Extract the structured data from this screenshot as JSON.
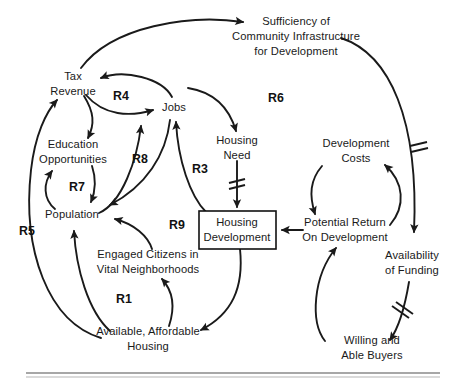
{
  "figure": {
    "type": "causal-loop-diagram",
    "background_color": "#ffffff",
    "ink_color": "#1a1a1a",
    "width": 463,
    "height": 386
  },
  "nodes": [
    {
      "id": "tax_revenue",
      "lines": [
        "Tax",
        "Revenue"
      ],
      "x": 73,
      "y": 84,
      "boxed": false
    },
    {
      "id": "sufficiency",
      "lines": [
        "Sufficiency of",
        "Community Infrastructure",
        "for Development"
      ],
      "x": 296,
      "y": 36,
      "boxed": false
    },
    {
      "id": "jobs",
      "lines": [
        "Jobs"
      ],
      "x": 174,
      "y": 108,
      "boxed": false
    },
    {
      "id": "education",
      "lines": [
        "Education",
        "Opportunities"
      ],
      "x": 73,
      "y": 152,
      "boxed": false
    },
    {
      "id": "housing_need",
      "lines": [
        "Housing",
        "Need"
      ],
      "x": 237,
      "y": 148,
      "boxed": false
    },
    {
      "id": "development_costs",
      "lines": [
        "Development",
        "Costs"
      ],
      "x": 356,
      "y": 151,
      "boxed": false
    },
    {
      "id": "population",
      "lines": [
        "Population"
      ],
      "x": 72,
      "y": 215,
      "boxed": false
    },
    {
      "id": "housing_development",
      "lines": [
        "Housing",
        "Development"
      ],
      "x": 237,
      "y": 230,
      "boxed": true
    },
    {
      "id": "potential_return",
      "lines": [
        "Potential Return",
        "On Development"
      ],
      "x": 345,
      "y": 230,
      "boxed": false
    },
    {
      "id": "availability",
      "lines": [
        "Availability",
        "of Funding"
      ],
      "x": 412,
      "y": 263,
      "boxed": false
    },
    {
      "id": "engaged_citizens",
      "lines": [
        "Engaged Citizens in",
        "Vital Neighborhoods"
      ],
      "x": 148,
      "y": 262,
      "boxed": false
    },
    {
      "id": "affordable_housing",
      "lines": [
        "Available, Affordable",
        "Housing"
      ],
      "x": 148,
      "y": 339,
      "boxed": false
    },
    {
      "id": "willing_buyers",
      "lines": [
        "Willing and",
        "Able Buyers"
      ],
      "x": 372,
      "y": 348,
      "boxed": false
    }
  ],
  "loop_labels": [
    {
      "id": "R4",
      "text": "R4",
      "x": 121,
      "y": 97
    },
    {
      "id": "R6",
      "text": "R6",
      "x": 276,
      "y": 99
    },
    {
      "id": "R8",
      "text": "R8",
      "x": 140,
      "y": 160
    },
    {
      "id": "R3",
      "text": "R3",
      "x": 200,
      "y": 170
    },
    {
      "id": "R7",
      "text": "R7",
      "x": 77,
      "y": 188
    },
    {
      "id": "R5",
      "text": "R5",
      "x": 27,
      "y": 232
    },
    {
      "id": "R9",
      "text": "R9",
      "x": 177,
      "y": 226
    },
    {
      "id": "R1",
      "text": "R1",
      "x": 124,
      "y": 300
    }
  ],
  "links": [
    {
      "id": "tax-to-sufficiency",
      "from": "tax_revenue",
      "to": "sufficiency",
      "delay": false
    },
    {
      "id": "jobs-to-tax",
      "from": "jobs",
      "to": "tax_revenue",
      "delay": false
    },
    {
      "id": "tax-to-jobs",
      "from": "tax_revenue",
      "to": "jobs",
      "delay": false
    },
    {
      "id": "tax-to-education",
      "from": "tax_revenue",
      "to": "education",
      "delay": false
    },
    {
      "id": "education-to-population",
      "from": "education",
      "to": "population",
      "delay": false
    },
    {
      "id": "population-to-education",
      "from": "population",
      "to": "education",
      "delay": false
    },
    {
      "id": "population-to-jobs",
      "from": "population",
      "to": "jobs",
      "delay": false
    },
    {
      "id": "jobs-to-population",
      "from": "jobs",
      "to": "population",
      "delay": false
    },
    {
      "id": "sufficiency-to-housing-need",
      "from": "sufficiency",
      "to": "housing_need",
      "delay": false
    },
    {
      "id": "housing-need-to-development",
      "from": "housing_need",
      "to": "housing_development",
      "delay": true
    },
    {
      "id": "development-to-jobs",
      "from": "housing_development",
      "to": "jobs",
      "delay": false
    },
    {
      "id": "development-to-affordable",
      "from": "housing_development",
      "to": "affordable_housing",
      "delay": false
    },
    {
      "id": "affordable-to-engaged",
      "from": "affordable_housing",
      "to": "engaged_citizens",
      "delay": false
    },
    {
      "id": "engaged-to-population",
      "from": "engaged_citizens",
      "to": "population",
      "delay": false
    },
    {
      "id": "affordable-to-population",
      "from": "affordable_housing",
      "to": "population",
      "delay": false
    },
    {
      "id": "affordable-to-tax",
      "from": "affordable_housing",
      "to": "tax_revenue",
      "delay": false
    },
    {
      "id": "sufficiency-to-availability",
      "from": "sufficiency",
      "to": "availability",
      "delay": true
    },
    {
      "id": "availability-to-willing",
      "from": "availability",
      "to": "willing_buyers",
      "delay": true
    },
    {
      "id": "willing-to-potential",
      "from": "willing_buyers",
      "to": "potential_return",
      "delay": false
    },
    {
      "id": "potential-to-development-costs",
      "from": "potential_return",
      "to": "development_costs",
      "delay": false
    },
    {
      "id": "costs-to-potential",
      "from": "development_costs",
      "to": "potential_return",
      "delay": false
    },
    {
      "id": "potential-to-housing-dev",
      "from": "potential_return",
      "to": "housing_development",
      "delay": false
    },
    {
      "id": "costs-to-availability",
      "from": "development_costs",
      "to": "availability",
      "delay": false
    }
  ],
  "footer_rule": {
    "visible": true,
    "x1": 26,
    "x2": 440,
    "y": 374
  }
}
